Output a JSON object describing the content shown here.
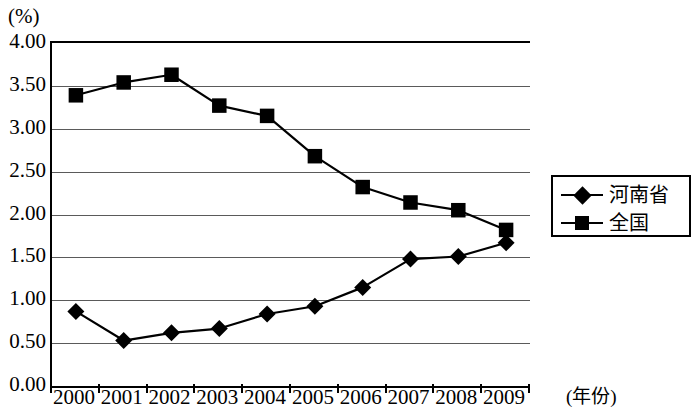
{
  "chart_data": {
    "type": "line",
    "title": "",
    "subtitle": "",
    "xlabel": "(年份)",
    "ylabel": "(%)",
    "categories": [
      "2000",
      "2001",
      "2002",
      "2003",
      "2004",
      "2005",
      "2006",
      "2007",
      "2008",
      "2009"
    ],
    "ylim": [
      0.0,
      4.0
    ],
    "ytick_labels": [
      "4.00",
      "3.50",
      "3.00",
      "2.50",
      "2.00",
      "1.50",
      "1.00",
      "0.50",
      "0.00"
    ],
    "ytick_values": [
      4.0,
      3.5,
      3.0,
      2.5,
      2.0,
      1.5,
      1.0,
      0.5,
      0.0
    ],
    "grid": true,
    "grid_axis": "y",
    "legend_position": "right",
    "series": [
      {
        "name": "河南省",
        "marker": "diamond",
        "color": "#000000",
        "values": [
          0.87,
          0.53,
          0.62,
          0.67,
          0.84,
          0.93,
          1.15,
          1.48,
          1.51,
          1.67
        ]
      },
      {
        "name": "全国",
        "marker": "square",
        "color": "#000000",
        "values": [
          3.39,
          3.54,
          3.63,
          3.27,
          3.15,
          2.68,
          2.32,
          2.14,
          2.05,
          1.82
        ]
      }
    ]
  },
  "legend": {
    "items": [
      {
        "label": "河南省",
        "marker": "diamond"
      },
      {
        "label": "全国",
        "marker": "square"
      }
    ]
  }
}
